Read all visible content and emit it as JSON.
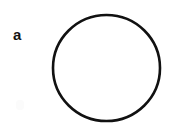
{
  "figure": {
    "panel_label": "a",
    "background_color": "#ffffff",
    "width": 192,
    "height": 123
  },
  "shapes": {
    "circle": {
      "name": "circle-outline",
      "center_x": 106.5,
      "center_y": 68,
      "radius_x": 53.5,
      "radius_y": 53,
      "stroke_color": "#111111",
      "stroke_width": 2.6,
      "fill": "none"
    }
  },
  "artifacts": {
    "smudge": {
      "name": "scan-smudge",
      "color": "#fbfbfb"
    }
  }
}
